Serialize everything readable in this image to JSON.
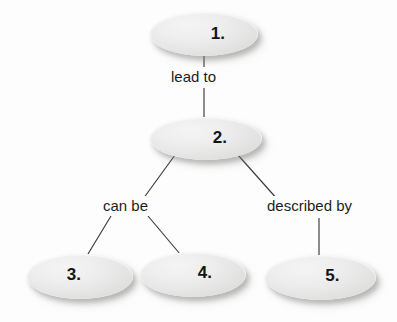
{
  "diagram": {
    "type": "concept-map",
    "title": "",
    "background_color": "#fdfdfd",
    "node_fill_color": "#ececec",
    "node_text_color": "#151515",
    "edge_label_text_color": "#1d1d1d",
    "connector_color": "#3a3a3a",
    "nodes": [
      {
        "id": "1",
        "label": "1."
      },
      {
        "id": "2",
        "label": "2."
      },
      {
        "id": "3",
        "label": "3."
      },
      {
        "id": "4",
        "label": "4."
      },
      {
        "id": "5",
        "label": "5."
      }
    ],
    "edge_labels": [
      {
        "id": "lead-to",
        "label": "lead to",
        "from": "1",
        "to": "2"
      },
      {
        "id": "can-be",
        "label": "can be",
        "from": "2",
        "to": "3,4"
      },
      {
        "id": "described-by",
        "label": "described by",
        "from": "2",
        "to": "5"
      }
    ]
  }
}
